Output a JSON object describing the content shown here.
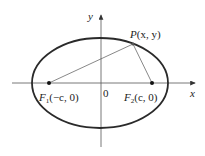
{
  "diagram": {
    "axes": {
      "x_label": "x",
      "y_label": "y",
      "origin_label": "0"
    },
    "points": {
      "P": {
        "name": "P",
        "coords": "(x, y)"
      },
      "F1": {
        "name": "F",
        "sub": "1",
        "coords": "(−c, 0)"
      },
      "F2": {
        "name": "F",
        "sub": "2",
        "coords": "(c, 0)"
      }
    },
    "colors": {
      "stroke": "#333333",
      "ellipse": "#2a2a2a",
      "background": "#ffffff"
    }
  }
}
